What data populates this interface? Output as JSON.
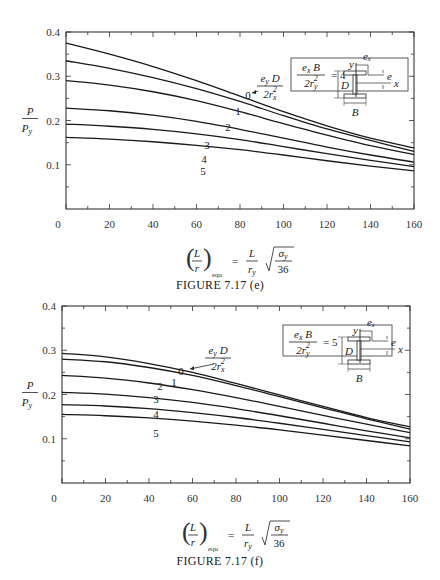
{
  "chart_data": [
    {
      "type": "line",
      "title": "FIGURE 7.17 (e)",
      "xlabel": "(L/r)_equ = (L/r_y) √(σ_y/36)",
      "ylabel": "P / P_y",
      "xlim": [
        0,
        160
      ],
      "ylim": [
        0,
        0.4
      ],
      "x_ticks": [
        0,
        20,
        40,
        60,
        80,
        100,
        120,
        140,
        160
      ],
      "y_ticks": [
        0.1,
        0.2,
        0.3,
        0.4
      ],
      "grid": false,
      "parameter_box": "e_x B / (2 r_y^2) = 4",
      "curve_parameter": "e_y D / (2 r_x^2)",
      "x": [
        0,
        20,
        40,
        60,
        80,
        100,
        120,
        140,
        160
      ],
      "series": [
        {
          "name": "0",
          "values": [
            0.375,
            0.35,
            0.322,
            0.29,
            0.255,
            0.22,
            0.188,
            0.16,
            0.138
          ]
        },
        {
          "name": "1",
          "values": [
            0.335,
            0.318,
            0.297,
            0.272,
            0.243,
            0.211,
            0.181,
            0.155,
            0.13
          ]
        },
        {
          "name": "2",
          "values": [
            0.29,
            0.28,
            0.265,
            0.245,
            0.22,
            0.193,
            0.167,
            0.143,
            0.123
          ]
        },
        {
          "name": "3",
          "values": [
            0.228,
            0.222,
            0.212,
            0.198,
            0.18,
            0.16,
            0.14,
            0.122,
            0.106
          ]
        },
        {
          "name": "4",
          "values": [
            0.192,
            0.187,
            0.18,
            0.17,
            0.157,
            0.141,
            0.125,
            0.11,
            0.096
          ]
        },
        {
          "name": "5",
          "values": [
            0.162,
            0.158,
            0.152,
            0.144,
            0.134,
            0.122,
            0.109,
            0.097,
            0.086
          ]
        }
      ]
    },
    {
      "type": "line",
      "title": "FIGURE 7.17 (f)",
      "xlabel": "(L/r)_equ = (L/r_y) √(σ_y/36)",
      "ylabel": "P / P_y",
      "xlim": [
        0,
        160
      ],
      "ylim": [
        0,
        0.4
      ],
      "x_ticks": [
        0,
        20,
        40,
        60,
        80,
        100,
        120,
        140,
        160
      ],
      "y_ticks": [
        0.1,
        0.2,
        0.3,
        0.4
      ],
      "grid": false,
      "parameter_box": "e_x B / (2 r_y^2) = 5",
      "curve_parameter": "e_y D / (2 r_x^2)",
      "x": [
        0,
        20,
        40,
        60,
        80,
        100,
        120,
        140,
        160
      ],
      "series": [
        {
          "name": "0",
          "values": [
            0.293,
            0.285,
            0.27,
            0.25,
            0.225,
            0.199,
            0.173,
            0.148,
            0.127
          ]
        },
        {
          "name": "1",
          "values": [
            0.28,
            0.274,
            0.261,
            0.243,
            0.22,
            0.195,
            0.17,
            0.145,
            0.122
          ]
        },
        {
          "name": "2",
          "values": [
            0.243,
            0.237,
            0.226,
            0.211,
            0.193,
            0.173,
            0.153,
            0.133,
            0.114
          ]
        },
        {
          "name": "3",
          "values": [
            0.205,
            0.201,
            0.193,
            0.182,
            0.168,
            0.152,
            0.135,
            0.118,
            0.102
          ]
        },
        {
          "name": "4",
          "values": [
            0.177,
            0.174,
            0.168,
            0.159,
            0.148,
            0.135,
            0.121,
            0.107,
            0.093
          ]
        },
        {
          "name": "5",
          "values": [
            0.155,
            0.152,
            0.147,
            0.14,
            0.131,
            0.12,
            0.108,
            0.096,
            0.084
          ]
        }
      ]
    }
  ],
  "labels": {
    "ylabel_top": "P",
    "ylabel_bottom": "P",
    "ylabel_sub": "y",
    "top_caption": "FIGURE 7.17 (e)",
    "bottom_caption": "FIGURE 7.17 (f)",
    "top_box_value": "= 4",
    "bottom_box_value": "= 5",
    "curve_param_num": "e",
    "equ_sub": "equ",
    "thirtysix": "36"
  }
}
